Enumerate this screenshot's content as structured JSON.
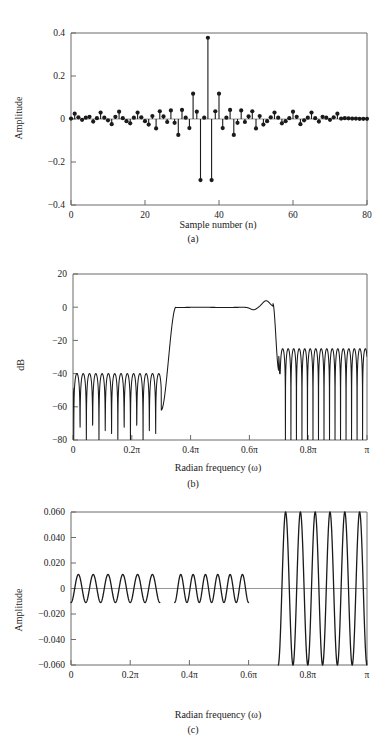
{
  "figure": {
    "title": "",
    "panels": [
      {
        "id": "a",
        "caption": "(a)"
      },
      {
        "id": "b",
        "caption": "(b)"
      },
      {
        "id": "c",
        "caption": "(c)"
      }
    ]
  },
  "chart_data": [
    {
      "type": "scatter",
      "id": "a",
      "title": "",
      "subtitle": "",
      "caption": "(a)",
      "xlabel": "Sample number (n)",
      "ylabel": "Amplitude",
      "xlim": [
        0,
        80
      ],
      "ylim": [
        -0.4,
        0.4
      ],
      "xticks": [
        0,
        20,
        40,
        60,
        80
      ],
      "xticklabels": [
        "0",
        "20",
        "40",
        "60",
        "80"
      ],
      "yticks": [
        -0.4,
        -0.2,
        0,
        0.2,
        0.4
      ],
      "yticklabels": [
        "-0.4",
        "-0.2",
        "0",
        "0.2",
        "0.4"
      ],
      "grid": false,
      "legend": null,
      "marker": "filled-circle",
      "stems": true,
      "x": [
        0,
        1,
        2,
        3,
        4,
        5,
        6,
        7,
        8,
        9,
        10,
        11,
        12,
        13,
        14,
        15,
        16,
        17,
        18,
        19,
        20,
        21,
        22,
        23,
        24,
        25,
        26,
        27,
        28,
        29,
        30,
        31,
        32,
        33,
        34,
        35,
        36,
        37,
        38,
        39,
        40,
        41,
        42,
        43,
        44,
        45,
        46,
        47,
        48,
        49,
        50,
        51,
        52,
        53,
        54,
        55,
        56,
        57,
        58,
        59,
        60,
        61,
        62,
        63,
        64,
        65,
        66,
        67,
        68,
        69,
        70,
        71,
        72,
        73,
        74,
        75,
        76,
        77,
        78,
        79,
        80
      ],
      "values": [
        0.002,
        0.025,
        0.008,
        -0.004,
        0.006,
        0.01,
        -0.012,
        0.004,
        0.03,
        0.006,
        -0.006,
        -0.024,
        0.01,
        0.034,
        0.004,
        -0.01,
        -0.02,
        0.006,
        0.03,
        0.008,
        -0.01,
        -0.026,
        0.014,
        -0.044,
        0.036,
        0.012,
        -0.014,
        0.04,
        -0.018,
        -0.074,
        0.042,
        0.006,
        -0.042,
        0.118,
        0.034,
        -0.284,
        0.006,
        0.378,
        -0.284,
        0.036,
        0.118,
        -0.042,
        0.006,
        0.042,
        -0.074,
        -0.018,
        0.04,
        -0.014,
        0.012,
        0.036,
        -0.044,
        0.014,
        -0.026,
        -0.01,
        0.008,
        0.03,
        0.006,
        -0.02,
        -0.01,
        0.004,
        0.034,
        0.01,
        -0.024,
        -0.006,
        0.006,
        0.03,
        0.004,
        -0.012,
        0.01,
        0.006,
        -0.004,
        0.008,
        0.025,
        0.002,
        0.004,
        0.003,
        0.002,
        0.002,
        0.001,
        0.001,
        0.001
      ]
    },
    {
      "type": "line",
      "id": "b",
      "title": "",
      "caption": "(b)",
      "xlabel": "Radian frequency (ω)",
      "ylabel": "dB",
      "xlim": [
        0,
        1
      ],
      "ylim": [
        -80,
        20
      ],
      "xticks": [
        0,
        0.2,
        0.4,
        0.6,
        0.8,
        1
      ],
      "xticklabels": [
        "0",
        "0.2π",
        "0.4π",
        "0.6π",
        "0.8π",
        "π"
      ],
      "yticks": [
        -80,
        -60,
        -40,
        -20,
        0,
        20
      ],
      "yticklabels": [
        "-80",
        "-60",
        "-40",
        "-20",
        "0",
        "20"
      ],
      "grid": false,
      "legend": null,
      "description": "Log magnitude of bandpass FIR filter; passband ~0.35π to 0.68π, stopband ripple peaks near -40 dB below 0.3π and near -25 dB above 0.7π",
      "passband": [
        0.35,
        0.68
      ],
      "stopband_low": [
        0.0,
        0.3
      ],
      "stopband_high": [
        0.7,
        1.0
      ],
      "stopband_low_peak_db": -40,
      "stopband_high_peak_db": -25,
      "passband_overshoot_db": 4,
      "lower_stopband_lobes": 14,
      "upper_stopband_lobes": 16
    },
    {
      "type": "line",
      "id": "c",
      "title": "",
      "caption": "(c)",
      "xlabel": "Radian frequency (ω)",
      "ylabel": "Amplitude",
      "xlim": [
        0,
        1
      ],
      "ylim": [
        -0.06,
        0.06
      ],
      "xticks": [
        0,
        0.2,
        0.4,
        0.6,
        0.8,
        1
      ],
      "xticklabels": [
        "0",
        "0.2π",
        "0.4π",
        "0.6π",
        "0.8π",
        "π"
      ],
      "yticks": [
        -0.06,
        -0.04,
        -0.02,
        0,
        0.02,
        0.04,
        0.06
      ],
      "yticklabels": [
        "-0.060",
        "-0.040",
        "-0.020",
        "0",
        "0.020",
        "0.040",
        "0.060"
      ],
      "grid": false,
      "legend": null,
      "description": "Weighted approximation error; band 0 to 0.30π ripples ±0.011, band 0.35π to 0.60π ripples ±0.011, band 0.70π to π ripples ±0.060",
      "segments": [
        {
          "range": [
            0.0,
            0.3
          ],
          "amplitude": 0.011,
          "lobes": 6
        },
        {
          "range": [
            0.35,
            0.6
          ],
          "amplitude": 0.011,
          "lobes": 6
        },
        {
          "range": [
            0.7,
            1.0
          ],
          "amplitude": 0.06,
          "lobes": 6
        }
      ],
      "zero_line": true
    }
  ],
  "colors": {
    "line": "#1a1a1a",
    "axis": "#6b6b6b",
    "text": "#1a1a1a",
    "background": "#ffffff"
  }
}
